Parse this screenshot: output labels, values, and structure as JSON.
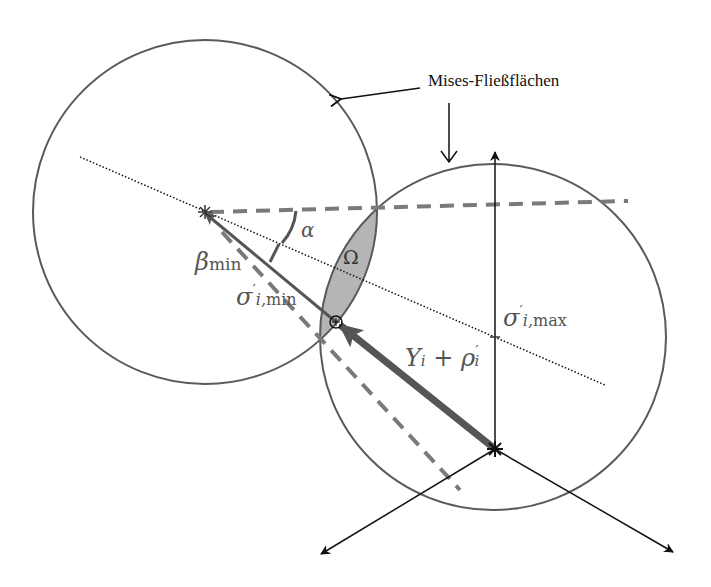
{
  "diagram": {
    "annotation": "Mises-Fließflächen",
    "labels": {
      "alpha": "α",
      "beta_base": "β",
      "beta_sub": "min",
      "omega": "Ω",
      "sigma_min_base": "σ",
      "sigma_min_sup": "′",
      "sigma_min_sub_i": "i,",
      "sigma_min_sub": "min",
      "sigma_max_base": "σ",
      "sigma_max_sup": "′",
      "sigma_max_sub_i": "i,",
      "sigma_max_sub": "max",
      "vector_Y": "Y",
      "vector_Y_sub": "i",
      "vector_plus": " + ",
      "vector_rho": "ρ",
      "vector_rho_sup": "′",
      "vector_rho_sub": "i"
    },
    "colors": {
      "circle_stroke": "#5a5a5a",
      "dashed": "#7a7a7a",
      "lens_fill": "#b5b5b5",
      "thick_arrow": "#555555",
      "axis": "#111111"
    },
    "geometry": {
      "left_circle": {
        "cx": 205,
        "cy": 212,
        "r": 172
      },
      "right_circle": {
        "cx": 493,
        "cy": 337,
        "r": 173
      },
      "origin": {
        "x": 495,
        "y": 449
      }
    }
  }
}
